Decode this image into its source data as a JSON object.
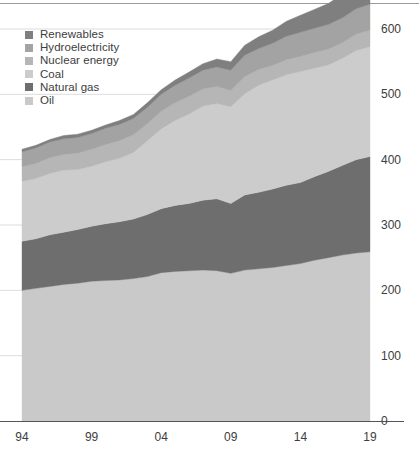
{
  "chart_data": {
    "type": "area",
    "stacked": true,
    "title": "",
    "subtitle": "",
    "xlabel": "",
    "ylabel": "",
    "xlim": [
      1994,
      2019
    ],
    "ylim": [
      0,
      600
    ],
    "grid": true,
    "grid_axis": "y",
    "legend_position": "top-left",
    "y_axis_position": "right",
    "x_tick_labels": [
      "94",
      "99",
      "04",
      "09",
      "14",
      "19"
    ],
    "x_tick_values": [
      1994,
      1999,
      2004,
      2009,
      2014,
      2019
    ],
    "y_tick_labels": [
      "0",
      "100",
      "200",
      "300",
      "400",
      "500",
      "600"
    ],
    "y_tick_values": [
      0,
      100,
      200,
      300,
      400,
      500,
      600
    ],
    "x": [
      1994,
      1995,
      1996,
      1997,
      1998,
      1999,
      2000,
      2001,
      2002,
      2003,
      2004,
      2005,
      2006,
      2007,
      2008,
      2009,
      2010,
      2011,
      2012,
      2013,
      2014,
      2015,
      2016,
      2017,
      2018,
      2019
    ],
    "series": [
      {
        "name": "Oil",
        "color": "#c9c9c9",
        "values": [
          200,
          203,
          206,
          209,
          211,
          214,
          215,
          216,
          218,
          221,
          227,
          229,
          230,
          231,
          230,
          226,
          231,
          233,
          235,
          238,
          241,
          246,
          250,
          254,
          257,
          259
        ]
      },
      {
        "name": "Natural gas",
        "color": "#6e6e6e",
        "values": [
          75,
          76,
          79,
          80,
          82,
          84,
          87,
          89,
          91,
          95,
          98,
          101,
          103,
          107,
          110,
          107,
          115,
          117,
          120,
          123,
          124,
          128,
          132,
          137,
          143,
          146
        ]
      },
      {
        "name": "Coal",
        "color": "#cccccc",
        "values": [
          92,
          92,
          94,
          95,
          92,
          92,
          95,
          97,
          102,
          113,
          122,
          130,
          137,
          144,
          146,
          148,
          155,
          164,
          167,
          169,
          170,
          166,
          163,
          164,
          167,
          168
        ]
      },
      {
        "name": "Nuclear energy",
        "color": "#b6b6b6",
        "values": [
          22,
          23,
          24,
          24,
          25,
          26,
          26,
          27,
          27,
          26,
          27,
          27,
          27,
          26,
          26,
          25,
          26,
          24,
          22,
          23,
          23,
          24,
          24,
          24,
          25,
          25
        ]
      },
      {
        "name": "Hydroelectricity",
        "color": "#a3a3a3",
        "values": [
          23,
          24,
          24,
          24,
          24,
          24,
          25,
          25,
          25,
          25,
          26,
          27,
          28,
          29,
          30,
          31,
          33,
          32,
          34,
          36,
          37,
          37,
          38,
          38,
          39,
          40
        ]
      },
      {
        "name": "Renewables",
        "color": "#7f7f7f",
        "values": [
          4,
          4,
          4,
          5,
          5,
          5,
          5,
          6,
          6,
          7,
          7,
          8,
          9,
          10,
          12,
          13,
          15,
          18,
          20,
          23,
          26,
          29,
          32,
          36,
          40,
          44
        ]
      }
    ],
    "legend_entries": [
      {
        "label": "Renewables",
        "color": "#7f7f7f"
      },
      {
        "label": "Hydroelectricity",
        "color": "#a3a3a3"
      },
      {
        "label": "Nuclear energy",
        "color": "#b6b6b6"
      },
      {
        "label": "Coal",
        "color": "#cccccc"
      },
      {
        "label": "Natural gas",
        "color": "#6e6e6e"
      },
      {
        "label": "Oil",
        "color": "#c9c9c9"
      }
    ],
    "colors": {
      "grid": "#dcdcdc",
      "axis": "#555555",
      "text": "#3d3d3d",
      "background": "#ffffff"
    }
  }
}
